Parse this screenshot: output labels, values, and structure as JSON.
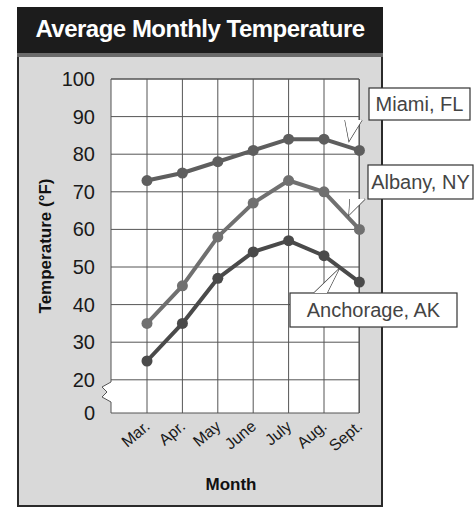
{
  "title": "Average Monthly Temperature",
  "chart_data": {
    "type": "line",
    "title": "Average Monthly Temperature",
    "xlabel": "Month",
    "ylabel": "Temperature (°F)",
    "categories": [
      "Mar.",
      "Apr.",
      "May",
      "June",
      "July",
      "Aug.",
      "Sept."
    ],
    "yticks": [
      0,
      20,
      30,
      40,
      50,
      60,
      70,
      80,
      90,
      100
    ],
    "ylim": [
      0,
      100
    ],
    "axis_break": "between 0 and 20",
    "grid": true,
    "series": [
      {
        "name": "Miami, FL",
        "values": [
          73,
          75,
          78,
          81,
          84,
          84,
          81
        ]
      },
      {
        "name": "Albany, NY",
        "values": [
          35,
          45,
          58,
          67,
          73,
          70,
          60
        ]
      },
      {
        "name": "Anchorage, AK",
        "values": [
          25,
          35,
          47,
          54,
          57,
          53,
          46
        ]
      }
    ],
    "colors": {
      "Miami, FL": "#5e5e5e",
      "Albany, NY": "#707070",
      "Anchorage, AK": "#4a4a4a"
    }
  }
}
